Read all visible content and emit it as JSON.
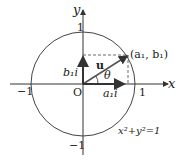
{
  "diagram": {
    "axis_x_label": "x",
    "axis_y_label": "y",
    "origin_label": "O",
    "tick_pos_x": "1",
    "tick_neg_x": "−1",
    "tick_pos_y": "1",
    "tick_neg_y": "−1",
    "point_label": "(a₁, b₁)",
    "vector_label": "u",
    "angle_label": "θ",
    "x_component_label": "a₁i",
    "y_component_label": "b₁i",
    "equation": "x²+y²=1",
    "colors": {
      "line": "#333333",
      "circle": "#444444",
      "background": "#ffffff"
    }
  }
}
